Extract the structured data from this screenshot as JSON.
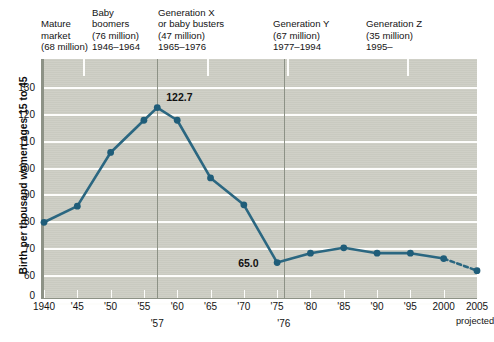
{
  "chart_data": {
    "type": "line",
    "title": "",
    "xlabel": "",
    "ylabel": "Birth per thousand women ages 15 to 45",
    "ylim": [
      55,
      136
    ],
    "y_ticks": [
      130,
      120,
      110,
      100,
      90,
      80,
      70,
      60,
      0
    ],
    "xlim": [
      1940,
      2005
    ],
    "x_ticks": [
      1940,
      1945,
      1950,
      1955,
      1960,
      1965,
      1970,
      1975,
      1980,
      1985,
      1990,
      1995,
      2000,
      2005
    ],
    "x_tick_labels": [
      "1940",
      "'45",
      "'50",
      "'55",
      "'60",
      "'65",
      "'70",
      "'75",
      "'80",
      "'85",
      "'90",
      "'95",
      "2000",
      "2005"
    ],
    "grid": "horizontal",
    "legend": "none",
    "x": [
      1940,
      1945,
      1950,
      1955,
      1957,
      1960,
      1965,
      1970,
      1975,
      1980,
      1985,
      1990,
      1995,
      2000,
      2005
    ],
    "values": [
      80.0,
      86.0,
      106.0,
      118.0,
      122.7,
      118.0,
      96.5,
      86.5,
      65.0,
      68.5,
      70.5,
      68.5,
      68.5,
      66.5,
      62.0
    ],
    "projected_from": 2000,
    "projected_note": "projected",
    "data_labels": [
      {
        "x": 1957,
        "value": 122.7,
        "text": "122.7"
      },
      {
        "x": 1975,
        "value": 65.0,
        "text": "65.0"
      }
    ],
    "axis_annotations": [
      {
        "x": 1957,
        "text": "'57"
      },
      {
        "x": 1976,
        "text": "'76"
      }
    ],
    "cohorts": [
      {
        "name": "Mature market",
        "lines": [
          "Mature",
          "market",
          "(68 million)"
        ],
        "population": "68 million",
        "years": "",
        "start": 1940,
        "end": 1945.8
      },
      {
        "name": "Baby boomers",
        "lines": [
          "Baby",
          "boomers",
          "(76 million)",
          "1946–1964"
        ],
        "population": "76 million",
        "years": "1946–1964",
        "start": 1945.8,
        "end": 1964.5
      },
      {
        "name": "Generation X or baby busters",
        "lines": [
          "Generation X",
          "or baby busters",
          "(47 million)",
          "1965–1976"
        ],
        "population": "47 million",
        "years": "1965–1976",
        "start": 1964.5,
        "end": 1976.5
      },
      {
        "name": "Generation Y",
        "lines": [
          "Generation Y",
          "(67 million)",
          "1977–1994"
        ],
        "population": "67 million",
        "years": "1977–1994",
        "start": 1976.5,
        "end": 1994.5
      },
      {
        "name": "Generation Z",
        "lines": [
          "Generation Z",
          "(35 million)",
          "1995–"
        ],
        "population": "35 million",
        "years": "1995–",
        "start": 1994.5,
        "end": 2005
      }
    ],
    "colors": {
      "line": "#2b6781",
      "marker": "#1f5d79",
      "plot_background": "#cdcec4",
      "gridline": "#fdfdfb",
      "axis": "#8d9286",
      "text": "#141414"
    }
  }
}
